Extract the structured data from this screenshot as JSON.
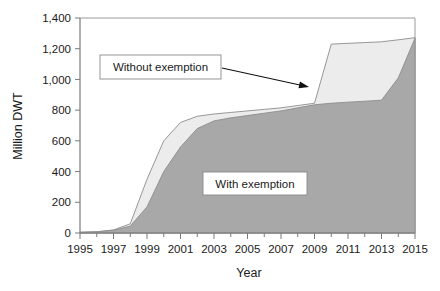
{
  "chart_data": {
    "type": "area",
    "title": "",
    "subtitle": "",
    "xlabel": "Year",
    "ylabel": "Million DWT",
    "xlim": [
      1995,
      2015
    ],
    "ylim": [
      0,
      1400
    ],
    "grid": false,
    "stacked": false,
    "legend_position": "inline-annotations",
    "y_ticks": [
      0,
      200,
      400,
      600,
      800,
      1000,
      1200,
      1400
    ],
    "y_tick_labels": [
      "0",
      "200",
      "400",
      "600",
      "800",
      "1,000",
      "1,200",
      "1,400"
    ],
    "x_ticks": [
      1995,
      1996,
      1997,
      1998,
      1999,
      2000,
      2001,
      2002,
      2003,
      2004,
      2005,
      2006,
      2007,
      2008,
      2009,
      2010,
      2011,
      2012,
      2013,
      2014,
      2015
    ],
    "x_tick_labels": [
      "1995",
      "",
      "1997",
      "",
      "1999",
      "",
      "2001",
      "",
      "2003",
      "",
      "2005",
      "",
      "2007",
      "",
      "2009",
      "",
      "2011",
      "",
      "2013",
      "",
      "2015"
    ],
    "x": [
      1995,
      1996,
      1997,
      1998,
      1999,
      2000,
      2001,
      2002,
      2003,
      2004,
      2005,
      2006,
      2007,
      2008,
      2009,
      2010,
      2011,
      2012,
      2013,
      2014,
      2015
    ],
    "series": [
      {
        "name": "Without exemption",
        "color": "#ececec",
        "edge_color": "#8c8c8c",
        "values": [
          5,
          8,
          20,
          60,
          350,
          600,
          720,
          760,
          775,
          785,
          795,
          805,
          815,
          830,
          845,
          1230,
          1235,
          1240,
          1245,
          1258,
          1272
        ]
      },
      {
        "name": "With exemption",
        "color": "#a8a8a8",
        "edge_color": "#8c8c8c",
        "values": [
          5,
          8,
          18,
          45,
          170,
          400,
          560,
          680,
          730,
          750,
          765,
          780,
          795,
          815,
          835,
          845,
          852,
          858,
          865,
          1010,
          1268
        ]
      }
    ],
    "annotations": [
      {
        "name": "without-exemption-label",
        "text": "Without exemption",
        "box": true,
        "x_px": 100,
        "y_px": 55,
        "width_px": 121,
        "height_px": 24
      },
      {
        "name": "with-exemption-label",
        "text": "With exemption",
        "box": true,
        "x_px": 203,
        "y_px": 172,
        "width_px": 104,
        "height_px": 23
      },
      {
        "name": "callout-arrow",
        "type": "arrow",
        "from_px": [
          222,
          68
        ],
        "to_px": [
          309,
          87
        ]
      }
    ],
    "colors": {
      "with_exemption_fill": "#a8a8a8",
      "without_exemption_fill": "#ececec",
      "axis": "#808080",
      "text": "#1a1a1a",
      "background": "#ffffff"
    }
  }
}
